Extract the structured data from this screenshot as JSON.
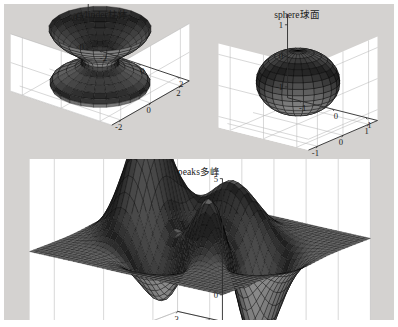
{
  "figure": {
    "background_color": "#d4d2d0",
    "wall_color": "#ffffff",
    "grid_color": "#b8b8b8",
    "axis_color": "#2a2a2a",
    "surface_color": "#2b2b2b",
    "mesh_color": "#000000",
    "window_border_color": "#ffffff"
  },
  "chart_data": [
    {
      "type": "surface3d",
      "id": "cylinder",
      "title": "cylinder柱体",
      "function": "cylinder(profile)",
      "description": "MATLAB cylinder surface with a vase / hourglass radius profile revolved about the z axis",
      "xlabel": "",
      "ylabel": "",
      "zlabel": "",
      "xlim": [
        -2.6,
        2.6
      ],
      "ylim": [
        -2.6,
        2.6
      ],
      "zlim": [
        0,
        1
      ],
      "xticks": [
        -2,
        0,
        2
      ],
      "xticklabels": [
        "-2",
        "0",
        "2"
      ],
      "yticks": [
        -2,
        0,
        2
      ],
      "yticklabels": [
        "2",
        "0",
        "-2"
      ],
      "zticks": [
        0,
        0.5,
        1
      ],
      "zticklabels": [
        "0",
        "0.5",
        "1"
      ],
      "grid": true,
      "legend": "none",
      "view_azimuth": -37.5,
      "view_elevation": 30,
      "radius_profile": [
        2.0,
        2.05,
        1.95,
        1.72,
        1.38,
        1.02,
        0.78,
        0.72,
        0.82,
        1.02,
        1.25,
        1.5,
        1.72,
        1.9,
        2.02,
        2.1
      ],
      "profile_z": [
        0,
        0.0667,
        0.1333,
        0.2,
        0.2667,
        0.3333,
        0.4,
        0.4667,
        0.5333,
        0.6,
        0.6667,
        0.7333,
        0.8,
        0.8667,
        0.9333,
        1.0
      ],
      "mesh_u": 24,
      "mesh_v": 15
    },
    {
      "type": "surface3d",
      "id": "sphere",
      "title": "sphere球面",
      "function": "sphere",
      "description": "MATLAB unit sphere rendered as a wireframe-shaded surface, flattened by the axis aspect ratio",
      "xlabel": "",
      "ylabel": "",
      "zlabel": "",
      "xlim": [
        -1.3,
        1.3
      ],
      "ylim": [
        -1.3,
        1.3
      ],
      "zlim": [
        -1,
        1
      ],
      "xticks": [
        -1,
        0,
        1
      ],
      "xticklabels": [
        "-1",
        "0",
        "1"
      ],
      "yticks": [
        -1,
        0,
        1
      ],
      "yticklabels": [
        "1",
        "0",
        "-1"
      ],
      "zticks": [
        -1,
        0,
        1
      ],
      "zticklabels": [
        "-1",
        "0",
        "1"
      ],
      "grid": true,
      "legend": "none",
      "view_azimuth": -37.5,
      "view_elevation": 30,
      "radius": 1,
      "mesh_u": 24,
      "mesh_v": 16
    },
    {
      "type": "surface3d",
      "id": "peaks",
      "title": "peaks多峰",
      "function": "peaks",
      "description": "MATLAB peaks function z = 3(1-x)^2 e^(-x^2-(y+1)^2) - 10(x/5 - x^3 - y^5) e^(-x^2-y^2) - 1/3 e^(-(x+1)^2 - y^2)",
      "xlabel": "",
      "ylabel": "",
      "zlabel": "",
      "xlim": [
        -3,
        3
      ],
      "ylim": [
        -3,
        3
      ],
      "zlim": [
        -8,
        8
      ],
      "xticks": [
        -3,
        -2,
        -1,
        0,
        1,
        2,
        3
      ],
      "xticklabels": [
        "-3",
        "-2",
        "-1",
        "0",
        "1",
        "2",
        "3"
      ],
      "yticks": [
        -2,
        0,
        2
      ],
      "yticklabels": [
        "2",
        "0",
        "-2"
      ],
      "zticks": [
        -5,
        0,
        5
      ],
      "zticklabels": [
        "-5",
        "0",
        "5"
      ],
      "grid": true,
      "legend": "none",
      "view_azimuth": -37.5,
      "view_elevation": 22,
      "mesh_n": 40,
      "zmax": 8.08,
      "zmin": -6.55
    }
  ]
}
